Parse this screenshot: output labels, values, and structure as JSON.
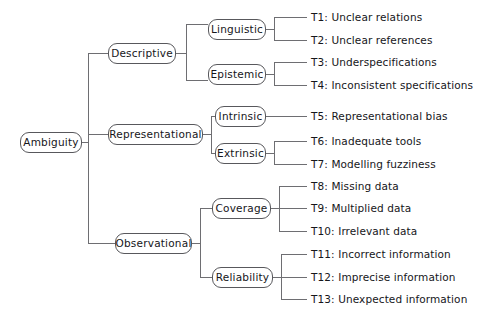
{
  "diagram": {
    "type": "tree",
    "orientation": "left-to-right",
    "colors": {
      "background": "#ffffff",
      "node_border": "#58585c",
      "node_fill": "#ffffff",
      "text": "#16161a",
      "connector": "#6e6e72"
    },
    "root": {
      "id": "root",
      "label": "Ambiguity"
    },
    "nodes": [
      {
        "id": "descriptive",
        "label": "Descriptive",
        "level": 2,
        "parent": "root"
      },
      {
        "id": "representational",
        "label": "Representational",
        "level": 2,
        "parent": "root"
      },
      {
        "id": "observational",
        "label": "Observational",
        "level": 2,
        "parent": "root"
      },
      {
        "id": "linguistic",
        "label": "Linguistic",
        "level": 3,
        "parent": "descriptive"
      },
      {
        "id": "epistemic",
        "label": "Epistemic",
        "level": 3,
        "parent": "descriptive"
      },
      {
        "id": "intrinsic",
        "label": "Intrinsic",
        "level": 3,
        "parent": "representational"
      },
      {
        "id": "extrinsic",
        "label": "Extrinsic",
        "level": 3,
        "parent": "representational"
      },
      {
        "id": "coverage",
        "label": "Coverage",
        "level": 3,
        "parent": "observational"
      },
      {
        "id": "reliability",
        "label": "Reliability",
        "level": 3,
        "parent": "observational"
      }
    ],
    "leaves": [
      {
        "id": "t1",
        "label": "T1: Unclear relations",
        "parent": "linguistic"
      },
      {
        "id": "t2",
        "label": "T2: Unclear references",
        "parent": "linguistic"
      },
      {
        "id": "t3",
        "label": "T3: Underspecifications",
        "parent": "epistemic"
      },
      {
        "id": "t4",
        "label": "T4: Inconsistent specifications",
        "parent": "epistemic"
      },
      {
        "id": "t5",
        "label": "T5: Representational bias",
        "parent": "intrinsic"
      },
      {
        "id": "t6",
        "label": "T6: Inadequate tools",
        "parent": "extrinsic"
      },
      {
        "id": "t7",
        "label": "T7: Modelling fuzziness",
        "parent": "extrinsic"
      },
      {
        "id": "t8",
        "label": "T8: Missing data",
        "parent": "coverage"
      },
      {
        "id": "t9",
        "label": "T9: Multiplied data",
        "parent": "coverage"
      },
      {
        "id": "t10",
        "label": "T10: Irrelevant data",
        "parent": "coverage"
      },
      {
        "id": "t11",
        "label": "T11: Incorrect information",
        "parent": "reliability"
      },
      {
        "id": "t12",
        "label": "T12: Imprecise information",
        "parent": "reliability"
      },
      {
        "id": "t13",
        "label": "T13: Unexpected information",
        "parent": "reliability"
      }
    ]
  }
}
